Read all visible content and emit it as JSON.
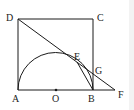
{
  "diagram": {
    "type": "geometry",
    "shape": "square ABCD with semicircle on AB, center O",
    "points": {
      "A": {
        "label": "A",
        "x": 18,
        "y": 90
      },
      "B": {
        "label": "B",
        "x": 93,
        "y": 90
      },
      "C": {
        "label": "C",
        "x": 93,
        "y": 19
      },
      "D": {
        "label": "D",
        "x": 18,
        "y": 19
      },
      "O": {
        "label": "O",
        "x": 56,
        "y": 90
      },
      "E": {
        "label": "E",
        "x": 77,
        "y": 62
      },
      "G": {
        "label": "G",
        "x": 93,
        "y": 72
      },
      "F": {
        "label": "F",
        "x": 115,
        "y": 90
      }
    },
    "line_color": "#1a1a1a"
  }
}
